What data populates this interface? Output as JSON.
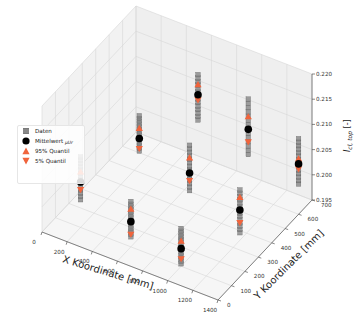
{
  "chart_data": {
    "type": "scatter3d",
    "title": "",
    "xlabel": "X Koordinate [mm]",
    "ylabel": "Y Koordinate [mm]",
    "zlabel": "I_cl, top [-]",
    "zlabel_main": "I",
    "zlabel_sub": "cl, top",
    "zlabel_unit": " [-]",
    "xlim": [
      0,
      1400
    ],
    "ylim": [
      0,
      700
    ],
    "zlim": [
      0.195,
      0.22
    ],
    "x_ticks": [
      "0",
      "200",
      "400",
      "600",
      "800",
      "1000",
      "1200",
      "1400"
    ],
    "y_ticks": [
      "0",
      "100",
      "200",
      "300",
      "400",
      "500",
      "600",
      "700"
    ],
    "z_ticks": [
      "0.195",
      "0.200",
      "0.205",
      "0.210",
      "0.215",
      "0.220"
    ],
    "grid": true,
    "legend_position": "left",
    "legend": [
      {
        "label": "Daten",
        "marker": "square",
        "color": "#808080"
      },
      {
        "label": "Mittelwert μ_Ur",
        "label_main": "Mittelwert ",
        "label_sub": "μUr",
        "marker": "circle",
        "color": "#000000"
      },
      {
        "label": "95% Quantil",
        "marker": "triangle-up",
        "color": "#f0643c"
      },
      {
        "label": "5% Quantil",
        "marker": "triangle-down",
        "color": "#f0643c"
      }
    ],
    "series": [
      {
        "name": "Mittelwert μ_Ur",
        "points": [
          {
            "x": 200,
            "y": 100,
            "z": 0.204
          },
          {
            "x": 400,
            "y": 350,
            "z": 0.2075
          },
          {
            "x": 600,
            "y": 600,
            "z": 0.211
          },
          {
            "x": 600,
            "y": 100,
            "z": 0.2
          },
          {
            "x": 800,
            "y": 350,
            "z": 0.2045
          },
          {
            "x": 1000,
            "y": 600,
            "z": 0.208
          },
          {
            "x": 1000,
            "y": 100,
            "z": 0.1985
          },
          {
            "x": 1200,
            "y": 350,
            "z": 0.201
          },
          {
            "x": 1400,
            "y": 600,
            "z": 0.205
          }
        ]
      },
      {
        "name": "95% Quantil",
        "points": [
          {
            "x": 200,
            "y": 100,
            "z": 0.206
          },
          {
            "x": 400,
            "y": 350,
            "z": 0.2095
          },
          {
            "x": 600,
            "y": 600,
            "z": 0.213
          },
          {
            "x": 600,
            "y": 100,
            "z": 0.2025
          },
          {
            "x": 800,
            "y": 350,
            "z": 0.2075
          },
          {
            "x": 1000,
            "y": 600,
            "z": 0.2105
          },
          {
            "x": 1000,
            "y": 100,
            "z": 0.2
          },
          {
            "x": 1200,
            "y": 350,
            "z": 0.2035
          },
          {
            "x": 1400,
            "y": 600,
            "z": 0.206
          }
        ]
      },
      {
        "name": "5% Quantil",
        "points": [
          {
            "x": 200,
            "y": 100,
            "z": 0.2025
          },
          {
            "x": 400,
            "y": 350,
            "z": 0.2055
          },
          {
            "x": 600,
            "y": 600,
            "z": 0.21
          },
          {
            "x": 600,
            "y": 100,
            "z": 0.1975
          },
          {
            "x": 800,
            "y": 350,
            "z": 0.203
          },
          {
            "x": 1000,
            "y": 600,
            "z": 0.2055
          },
          {
            "x": 1000,
            "y": 100,
            "z": 0.1965
          },
          {
            "x": 1200,
            "y": 350,
            "z": 0.1985
          },
          {
            "x": 1400,
            "y": 600,
            "z": 0.204
          }
        ]
      },
      {
        "name": "Daten",
        "columns": [
          {
            "x": 200,
            "y": 100,
            "z_min": 0.2005,
            "z_max": 0.209
          },
          {
            "x": 400,
            "y": 350,
            "z_min": 0.205,
            "z_max": 0.212
          },
          {
            "x": 600,
            "y": 600,
            "z_min": 0.206,
            "z_max": 0.215
          },
          {
            "x": 600,
            "y": 100,
            "z_min": 0.197,
            "z_max": 0.204
          },
          {
            "x": 800,
            "y": 350,
            "z_min": 0.201,
            "z_max": 0.21
          },
          {
            "x": 1000,
            "y": 600,
            "z_min": 0.203,
            "z_max": 0.214
          },
          {
            "x": 1000,
            "y": 100,
            "z_min": 0.1955,
            "z_max": 0.2025
          },
          {
            "x": 1200,
            "y": 350,
            "z_min": 0.1965,
            "z_max": 0.205
          },
          {
            "x": 1400,
            "y": 600,
            "z_min": 0.201,
            "z_max": 0.21
          }
        ]
      }
    ]
  }
}
